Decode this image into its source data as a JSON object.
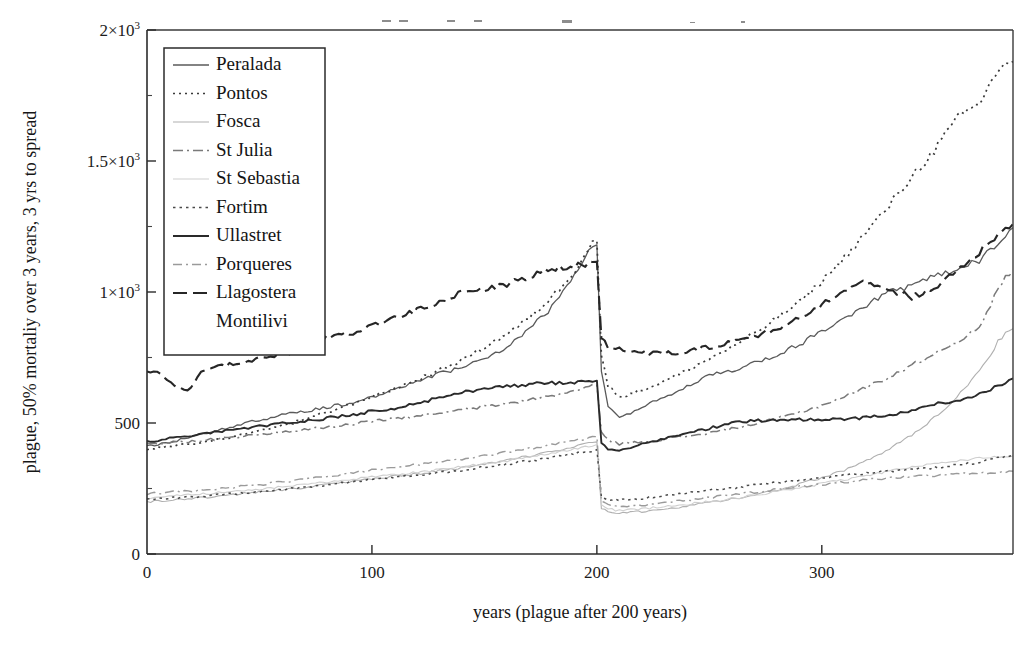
{
  "figure": {
    "name": "plague-mortality-spread-line-chart",
    "background": "#ffffff",
    "ink_color": "#1c1c1c"
  },
  "chart_data": {
    "type": "line",
    "title": "",
    "xlabel": "years (plague after 200 years)",
    "ylabel": "plague, 50% mortaliy over 3 years, 3 yrs to spread",
    "xlim": [
      0,
      385
    ],
    "ylim": [
      0,
      2000
    ],
    "xticks": [
      0,
      100,
      200,
      300
    ],
    "xtick_labels": [
      "0",
      "100",
      "200",
      "300"
    ],
    "yticks": [
      0,
      500,
      1000,
      1500,
      2000
    ],
    "ytick_labels": [
      "0",
      "500",
      "1×10",
      "1.5×10",
      "2×10"
    ],
    "ytick_label_exponents": [
      "",
      "",
      "3",
      "3",
      "3"
    ],
    "yticks_minor": [
      250,
      750,
      1250,
      1750
    ],
    "grid": false,
    "legend_position": "upper-left-inside",
    "annotations": [
      {
        "text": "plague event",
        "x": 200,
        "note": "abrupt population drop at year 200"
      }
    ],
    "series": [
      {
        "name": "Peralada",
        "style": "solid-thin",
        "color": "#5a5a5a",
        "dash": "none",
        "width": 1.3,
        "x": [
          0,
          10,
          20,
          30,
          40,
          50,
          60,
          70,
          80,
          90,
          100,
          110,
          120,
          130,
          140,
          150,
          160,
          170,
          180,
          190,
          198,
          200,
          202,
          205,
          210,
          220,
          230,
          240,
          250,
          260,
          270,
          280,
          290,
          300,
          310,
          320,
          330,
          340,
          350,
          360,
          370,
          380,
          385
        ],
        "y": [
          410,
          425,
          450,
          470,
          490,
          512,
          530,
          545,
          560,
          575,
          600,
          625,
          660,
          690,
          710,
          745,
          790,
          860,
          940,
          1060,
          1175,
          1180,
          700,
          560,
          520,
          560,
          600,
          640,
          680,
          700,
          730,
          760,
          800,
          850,
          900,
          950,
          1000,
          1020,
          1060,
          1090,
          1120,
          1200,
          1245
        ]
      },
      {
        "name": "Pontos",
        "style": "dotted",
        "color": "#3a3a3a",
        "dash": "2,4",
        "width": 1.7,
        "x": [
          0,
          10,
          20,
          30,
          40,
          50,
          60,
          70,
          80,
          90,
          100,
          110,
          120,
          130,
          140,
          150,
          160,
          170,
          180,
          190,
          198,
          200,
          202,
          205,
          210,
          220,
          230,
          240,
          250,
          260,
          270,
          280,
          290,
          300,
          310,
          320,
          330,
          340,
          350,
          360,
          370,
          380,
          385
        ],
        "y": [
          400,
          410,
          420,
          435,
          450,
          468,
          490,
          512,
          540,
          570,
          600,
          630,
          665,
          700,
          740,
          790,
          840,
          900,
          980,
          1080,
          1190,
          1195,
          760,
          640,
          600,
          625,
          660,
          700,
          745,
          790,
          840,
          900,
          960,
          1040,
          1130,
          1230,
          1330,
          1440,
          1540,
          1660,
          1720,
          1870,
          1880
        ]
      },
      {
        "name": "Fosca",
        "style": "solid-faint",
        "color": "#b0b0b0",
        "dash": "none",
        "width": 1.1,
        "x": [
          0,
          10,
          20,
          30,
          40,
          50,
          60,
          70,
          80,
          90,
          100,
          110,
          120,
          130,
          140,
          150,
          160,
          170,
          180,
          190,
          198,
          200,
          202,
          205,
          210,
          220,
          230,
          240,
          250,
          260,
          270,
          280,
          290,
          300,
          310,
          320,
          330,
          340,
          350,
          360,
          370,
          380,
          385
        ],
        "y": [
          200,
          205,
          212,
          220,
          228,
          236,
          245,
          254,
          264,
          275,
          286,
          296,
          306,
          318,
          330,
          344,
          358,
          374,
          392,
          410,
          425,
          428,
          175,
          160,
          155,
          162,
          172,
          184,
          196,
          210,
          226,
          244,
          266,
          292,
          320,
          356,
          400,
          455,
          520,
          600,
          700,
          830,
          860
        ]
      },
      {
        "name": "St Julia",
        "style": "dash-dot",
        "color": "#7a7a7a",
        "dash": "10,4,2,4",
        "width": 1.5,
        "x": [
          0,
          10,
          20,
          30,
          40,
          50,
          60,
          70,
          80,
          90,
          100,
          110,
          120,
          130,
          140,
          150,
          160,
          170,
          180,
          190,
          198,
          200,
          202,
          205,
          210,
          220,
          230,
          240,
          250,
          260,
          270,
          280,
          290,
          300,
          310,
          320,
          330,
          340,
          350,
          360,
          370,
          380,
          385
        ],
        "y": [
          420,
          425,
          430,
          438,
          446,
          455,
          464,
          474,
          484,
          495,
          506,
          516,
          527,
          538,
          550,
          562,
          574,
          588,
          604,
          622,
          640,
          645,
          470,
          435,
          420,
          428,
          438,
          450,
          462,
          478,
          496,
          516,
          540,
          568,
          600,
          636,
          676,
          720,
          764,
          812,
          860,
          1040,
          1080
        ]
      },
      {
        "name": "St Sebastia",
        "style": "solid-very-faint",
        "color": "#cfcfcf",
        "dash": "none",
        "width": 1.1,
        "x": [
          0,
          10,
          20,
          30,
          40,
          50,
          60,
          70,
          80,
          90,
          100,
          110,
          120,
          130,
          140,
          150,
          160,
          170,
          180,
          190,
          198,
          200,
          202,
          205,
          210,
          220,
          230,
          240,
          250,
          260,
          270,
          280,
          290,
          300,
          310,
          320,
          330,
          340,
          350,
          360,
          370,
          380,
          385
        ],
        "y": [
          215,
          220,
          226,
          232,
          240,
          248,
          256,
          264,
          274,
          284,
          294,
          303,
          312,
          322,
          333,
          344,
          356,
          369,
          384,
          400,
          414,
          418,
          186,
          172,
          166,
          172,
          180,
          190,
          200,
          212,
          224,
          238,
          252,
          268,
          284,
          300,
          316,
          330,
          344,
          356,
          366,
          372,
          375
        ]
      },
      {
        "name": "Fortim",
        "style": "fine-dotted",
        "color": "#4a4a4a",
        "dash": "2.5,4",
        "width": 1.5,
        "x": [
          0,
          10,
          20,
          30,
          40,
          50,
          60,
          70,
          80,
          90,
          100,
          110,
          120,
          130,
          140,
          150,
          160,
          170,
          180,
          190,
          198,
          200,
          202,
          205,
          210,
          220,
          230,
          240,
          250,
          260,
          270,
          280,
          290,
          300,
          310,
          320,
          330,
          340,
          350,
          360,
          370,
          380,
          385
        ],
        "y": [
          210,
          213,
          218,
          224,
          231,
          238,
          246,
          255,
          264,
          274,
          284,
          292,
          301,
          311,
          321,
          332,
          343,
          355,
          368,
          382,
          394,
          398,
          218,
          208,
          205,
          212,
          222,
          232,
          243,
          252,
          262,
          272,
          282,
          292,
          300,
          308,
          316,
          322,
          330,
          340,
          350,
          370,
          378
        ]
      },
      {
        "name": "Ullastret",
        "style": "solid-thick",
        "color": "#2a2a2a",
        "dash": "none",
        "width": 1.9,
        "x": [
          0,
          10,
          20,
          30,
          40,
          50,
          60,
          70,
          80,
          90,
          100,
          110,
          120,
          130,
          140,
          150,
          160,
          170,
          180,
          190,
          198,
          200,
          202,
          205,
          210,
          220,
          230,
          240,
          250,
          260,
          270,
          280,
          290,
          300,
          310,
          320,
          330,
          340,
          350,
          360,
          370,
          380,
          385
        ],
        "y": [
          430,
          440,
          452,
          464,
          476,
          488,
          498,
          508,
          518,
          530,
          545,
          556,
          572,
          598,
          618,
          632,
          640,
          648,
          652,
          656,
          660,
          662,
          420,
          400,
          398,
          418,
          440,
          460,
          480,
          500,
          508,
          512,
          514,
          514,
          516,
          520,
          530,
          548,
          570,
          588,
          610,
          650,
          670
        ]
      },
      {
        "name": "Porqueres",
        "style": "dash-dot-faint",
        "color": "#9a9a9a",
        "dash": "9,4,2,4",
        "width": 1.4,
        "x": [
          0,
          10,
          20,
          30,
          40,
          50,
          60,
          70,
          80,
          90,
          100,
          110,
          120,
          130,
          140,
          150,
          160,
          170,
          180,
          190,
          198,
          200,
          202,
          205,
          210,
          220,
          230,
          240,
          250,
          260,
          270,
          280,
          290,
          300,
          310,
          320,
          330,
          340,
          350,
          360,
          370,
          380,
          385
        ],
        "y": [
          230,
          235,
          241,
          248,
          256,
          265,
          275,
          285,
          296,
          308,
          320,
          330,
          340,
          352,
          363,
          375,
          388,
          402,
          417,
          432,
          444,
          448,
          198,
          186,
          180,
          186,
          196,
          206,
          216,
          226,
          236,
          246,
          256,
          266,
          275,
          283,
          290,
          296,
          300,
          304,
          308,
          312,
          316
        ]
      },
      {
        "name": "Llagostera",
        "style": "long-dash",
        "color": "#262626",
        "dash": "14,6",
        "width": 2.1,
        "x": [
          0,
          6,
          12,
          18,
          24,
          30,
          40,
          50,
          60,
          70,
          80,
          90,
          100,
          110,
          120,
          130,
          140,
          150,
          160,
          170,
          180,
          190,
          198,
          200,
          202,
          205,
          210,
          220,
          230,
          240,
          250,
          260,
          270,
          280,
          290,
          300,
          310,
          320,
          330,
          340,
          350,
          360,
          370,
          380,
          385
        ],
        "y": [
          700,
          690,
          640,
          620,
          700,
          710,
          730,
          745,
          760,
          790,
          830,
          840,
          870,
          900,
          930,
          960,
          1000,
          1010,
          1030,
          1060,
          1090,
          1100,
          1110,
          1115,
          830,
          790,
          780,
          770,
          765,
          770,
          790,
          810,
          830,
          860,
          900,
          950,
          1010,
          1040,
          1010,
          980,
          1010,
          1080,
          1150,
          1230,
          1260
        ]
      },
      {
        "name": "Montilivi",
        "style": "none",
        "color": "#ffffff",
        "dash": "none",
        "width": 0,
        "x": [],
        "y": []
      }
    ]
  },
  "legend": {
    "name": "series-legend",
    "entries": [
      {
        "label": "Peralada",
        "sample": "solid-thin"
      },
      {
        "label": "Pontos",
        "sample": "dotted"
      },
      {
        "label": "Fosca",
        "sample": "solid-faint"
      },
      {
        "label": "St Julia",
        "sample": "dash-dot"
      },
      {
        "label": "St Sebastia",
        "sample": "solid-very-faint"
      },
      {
        "label": "Fortim",
        "sample": "fine-dotted"
      },
      {
        "label": "Ullastret",
        "sample": "solid-thick"
      },
      {
        "label": "Porqueres",
        "sample": "dash-dot-faint"
      },
      {
        "label": "Llagostera",
        "sample": "long-dash"
      },
      {
        "label": "Montilivi",
        "sample": "none"
      }
    ]
  },
  "specks": [
    {
      "x": 382,
      "y": 20,
      "w": 9,
      "h": 2
    },
    {
      "x": 399,
      "y": 20,
      "w": 9,
      "h": 2
    },
    {
      "x": 447,
      "y": 20,
      "w": 8,
      "h": 2
    },
    {
      "x": 474,
      "y": 20,
      "w": 8,
      "h": 2
    },
    {
      "x": 562,
      "y": 20,
      "w": 10,
      "h": 3
    },
    {
      "x": 690,
      "y": 22,
      "w": 5,
      "h": 1
    },
    {
      "x": 741,
      "y": 21,
      "w": 4,
      "h": 2
    }
  ]
}
